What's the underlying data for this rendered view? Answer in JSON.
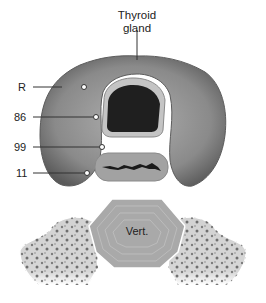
{
  "figure": {
    "title_line1": "Thyroid",
    "title_line2": "gland",
    "labels": [
      {
        "text": "R",
        "y": 87
      },
      {
        "text": "86",
        "y": 117
      },
      {
        "text": "99",
        "y": 147
      },
      {
        "text": "11",
        "y": 173
      }
    ],
    "vertebra_label": "Vert.",
    "colors": {
      "thyroid": "#7a7a7a",
      "thyroid_light": "#a8a8a8",
      "trachea_lumen": "#1e1e1e",
      "trachea_wall": "#b8b8b8",
      "esophagus": "#9a9a9a",
      "vertebra": "#a9a9a9",
      "bone": "#cfcfcf"
    }
  }
}
